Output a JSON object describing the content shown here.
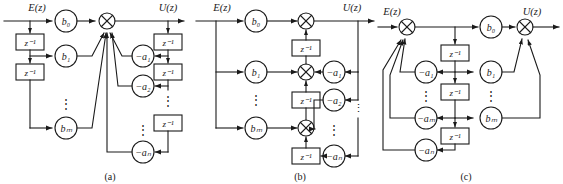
{
  "figure": {
    "type": "signal-flow-block-diagram",
    "panels": [
      {
        "id": "a",
        "caption": "(a)",
        "input_label": "E(z)",
        "output_label": "U(z)",
        "feedforward_gains": [
          "b₀",
          "b₁",
          "bₘ"
        ],
        "feedback_gains": [
          "−a₁",
          "−a₂",
          "−aₙ"
        ],
        "delay_label": "z⁻¹",
        "delay_count_left": 3,
        "delay_count_right": 3,
        "summing_junctions": 1,
        "ellipsis": "⋮"
      },
      {
        "id": "b",
        "caption": "(b)",
        "input_label": "E(z)",
        "output_label": "U(z)",
        "feedforward_gains": [
          "b₀",
          "b₁",
          "bₘ"
        ],
        "feedback_gains": [
          "−a₁",
          "−a₂",
          "−aₙ"
        ],
        "delay_label": "z⁻¹",
        "delay_count": 3,
        "summing_junctions": 3,
        "ellipsis": "⋮"
      },
      {
        "id": "c",
        "caption": "(c)",
        "input_label": "E(z)",
        "output_label": "U(z)",
        "feedforward_gains": [
          "b₀",
          "b₁",
          "bₘ"
        ],
        "feedback_gains": [
          "−a₁",
          "−aₘ",
          "−aₙ"
        ],
        "delay_label": "z⁻¹",
        "delay_count": 3,
        "summing_junctions": 2,
        "ellipsis": "⋮"
      }
    ]
  },
  "style": {
    "line_color": "#1a1a1a",
    "box_fill": "#ffffff",
    "circle_fill": "#ffffff",
    "background": "#ffffff"
  },
  "text": {
    "delay": "z⁻¹",
    "e_of_z": "E(z)",
    "u_of_z": "U(z)",
    "b0": "b₀",
    "b1": "b₁",
    "bm": "bₘ",
    "a1": "−a₁",
    "a2": "−a₂",
    "am": "−aₘ",
    "an": "−aₙ",
    "vdots": "⋮",
    "cap_a": "(a)",
    "cap_b": "(b)",
    "cap_c": "(c)"
  }
}
